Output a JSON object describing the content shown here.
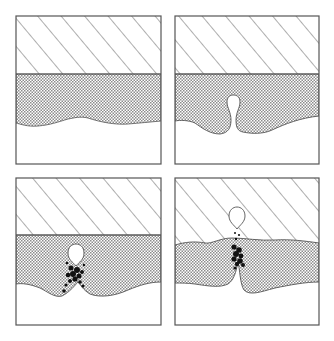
{
  "figure": {
    "layout": "2x2 grid of schematic cross-section panels",
    "colors": {
      "background": "#ffffff",
      "outline": "#555555",
      "hatch_lines": "#6a6a6a",
      "crosshatch_fill": "#8c8c8c",
      "particles": "#111111"
    },
    "panels": [
      {
        "position": "top-left",
        "stage": 1,
        "description": "Hatched top layer over crosshatched layer with gently wavy lower boundary; empty region below"
      },
      {
        "position": "top-right",
        "stage": 2,
        "description": "Bubble/cavity pocket forms rising up from lower wavy boundary into crosshatched layer"
      },
      {
        "position": "bottom-left",
        "stage": 3,
        "description": "Bubble detached inside crosshatched layer with cluster of dark particles below it along a channel"
      },
      {
        "position": "bottom-right",
        "stage": 4,
        "description": "Bubble escapes into hatched top layer; dark particles fill channel through the crosshatched layer, which has deformed irregular upper and lower boundaries"
      }
    ],
    "legend": {
      "layers": [
        "diagonal-hatched top layer",
        "crosshatched middle layer",
        "blank lower region"
      ]
    }
  }
}
